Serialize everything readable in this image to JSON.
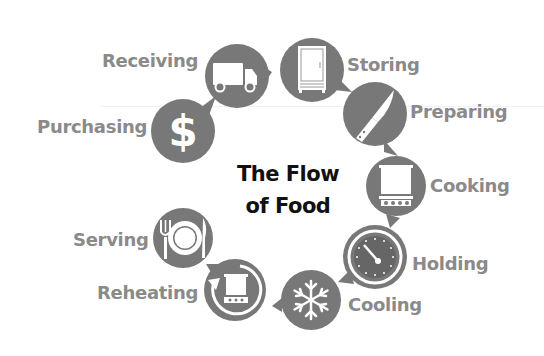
{
  "title": {
    "line1": "The Flow",
    "line2": "of Food"
  },
  "colors": {
    "circle_fill": "#787878",
    "label_text": "#8a8a8a",
    "icon_fill": "#ffffff",
    "title_text": "#111111"
  },
  "steps": [
    {
      "label": "Purchasing",
      "icon": "dollar-sign-icon"
    },
    {
      "label": "Receiving",
      "icon": "delivery-truck-icon"
    },
    {
      "label": "Storing",
      "icon": "refrigerator-icon"
    },
    {
      "label": "Preparing",
      "icon": "chef-knife-icon"
    },
    {
      "label": "Cooking",
      "icon": "cooking-pot-icon"
    },
    {
      "label": "Holding",
      "icon": "thermometer-dial-icon"
    },
    {
      "label": "Cooling",
      "icon": "snowflake-icon"
    },
    {
      "label": "Reheating",
      "icon": "reheat-pot-icon"
    },
    {
      "label": "Serving",
      "icon": "plate-fork-knife-icon"
    }
  ]
}
